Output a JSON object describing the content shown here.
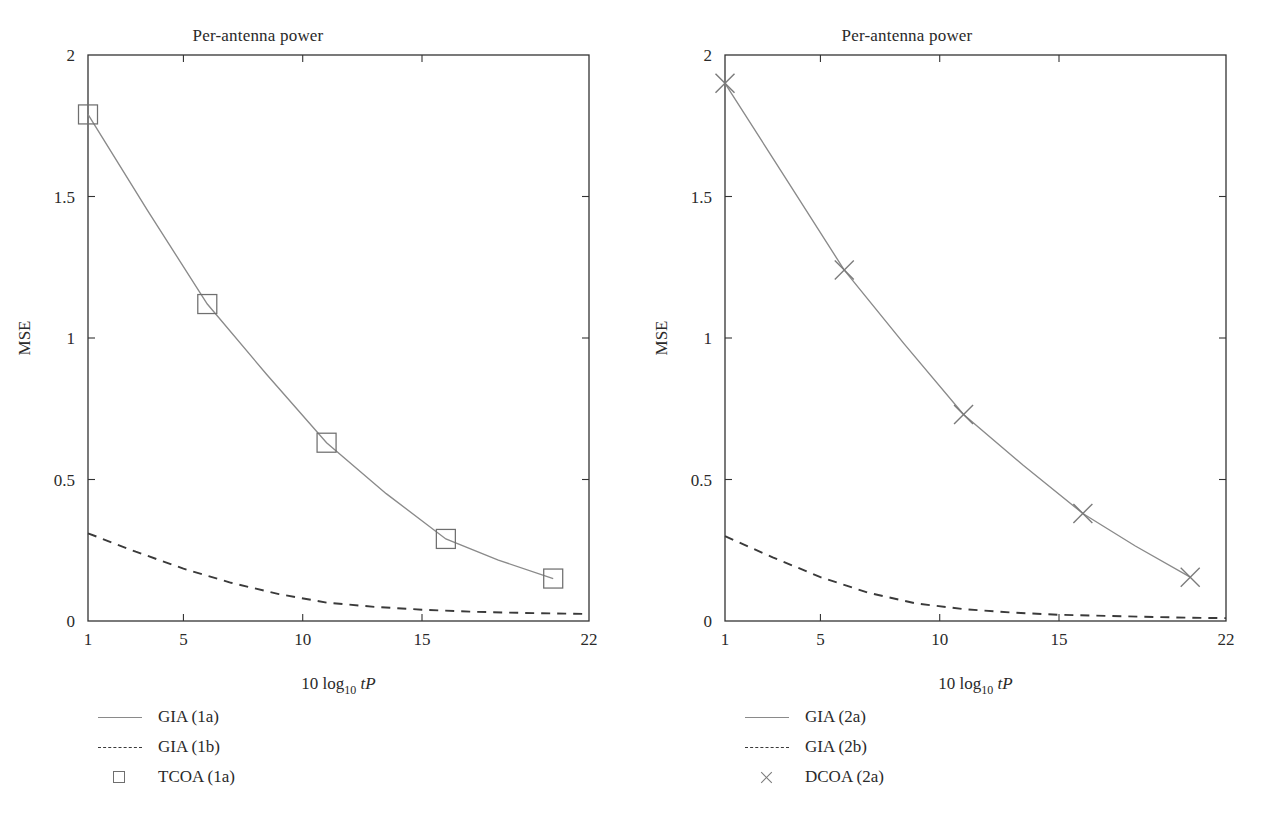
{
  "figure": {
    "background": "#ffffff",
    "panel_count": 2
  },
  "panels": [
    {
      "id": "left",
      "title": "Per-antenna power",
      "ylabel": "MSE",
      "xlabel_parts": {
        "lead": "10 log",
        "sub": "10",
        "var": "tP"
      },
      "legend": [
        {
          "label": "GIA (1a)",
          "key": "solid-line-key"
        },
        {
          "label": "GIA (1b)",
          "key": "dashed-line-key"
        },
        {
          "label": "TCOA (1a)",
          "key": "square-marker-key"
        }
      ]
    },
    {
      "id": "right",
      "title": "Per-antenna power",
      "ylabel": "MSE",
      "xlabel_parts": {
        "lead": "10 log",
        "sub": "10",
        "var": "tP"
      },
      "legend": [
        {
          "label": "GIA (2a)",
          "key": "solid-line-key"
        },
        {
          "label": "GIA (2b)",
          "key": "dashed-line-key"
        },
        {
          "label": "DCOA (2a)",
          "key": "cross-marker-key"
        }
      ]
    }
  ],
  "chart_data": [
    {
      "type": "line",
      "panel": "left",
      "title": "Per-antenna power",
      "xlabel": "10 log10 tP",
      "ylabel": "MSE",
      "xlim": [
        1,
        22
      ],
      "ylim": [
        0,
        2
      ],
      "xticks": [
        1,
        5,
        10,
        15,
        22
      ],
      "xtick_labels": [
        "1",
        "5",
        "10",
        "15",
        "22"
      ],
      "yticks": [
        0,
        0.5,
        1,
        1.5,
        2
      ],
      "ytick_labels": [
        "0",
        "0.5",
        "1",
        "1.5",
        "2"
      ],
      "grid": false,
      "legend_position": "below-left",
      "series": [
        {
          "name": "GIA (1a)",
          "style": "solid",
          "color": "#8a8a8a",
          "marker": "none",
          "x": [
            1,
            3.5,
            6,
            8.5,
            11,
            13.5,
            16,
            18.2,
            20.5
          ],
          "values": [
            1.79,
            1.45,
            1.12,
            0.87,
            0.63,
            0.45,
            0.29,
            0.215,
            0.15
          ]
        },
        {
          "name": "GIA (1b)",
          "style": "dashed",
          "color": "#3a3a3a",
          "marker": "none",
          "x": [
            1,
            3,
            5,
            7,
            9,
            11,
            13,
            15,
            17,
            19,
            21,
            22
          ],
          "values": [
            0.31,
            0.245,
            0.185,
            0.135,
            0.095,
            0.065,
            0.05,
            0.04,
            0.033,
            0.029,
            0.026,
            0.025
          ]
        },
        {
          "name": "TCOA (1a)",
          "style": "markers-only",
          "color": "#6f6f6f",
          "marker": "square",
          "x": [
            1,
            6,
            11,
            16,
            20.5
          ],
          "values": [
            1.79,
            1.12,
            0.63,
            0.29,
            0.15
          ]
        }
      ]
    },
    {
      "type": "line",
      "panel": "right",
      "title": "Per-antenna power",
      "xlabel": "10 log10 tP",
      "ylabel": "MSE",
      "xlim": [
        1,
        22
      ],
      "ylim": [
        0,
        2
      ],
      "xticks": [
        1,
        5,
        10,
        15,
        22
      ],
      "xtick_labels": [
        "1",
        "5",
        "10",
        "15",
        "22"
      ],
      "yticks": [
        0,
        0.5,
        1,
        1.5,
        2
      ],
      "ytick_labels": [
        "0",
        "0.5",
        "1",
        "1.5",
        "2"
      ],
      "grid": false,
      "legend_position": "below-left",
      "series": [
        {
          "name": "GIA (2a)",
          "style": "solid",
          "color": "#8a8a8a",
          "marker": "none",
          "x": [
            1,
            3.5,
            6,
            8.5,
            11,
            13.5,
            16,
            18.2,
            20.5
          ],
          "values": [
            1.9,
            1.57,
            1.24,
            0.98,
            0.73,
            0.55,
            0.38,
            0.265,
            0.155
          ]
        },
        {
          "name": "GIA (2b)",
          "style": "dashed",
          "color": "#3a3a3a",
          "marker": "none",
          "x": [
            1,
            3,
            5,
            7,
            9,
            11,
            13,
            15,
            17,
            19,
            21,
            22
          ],
          "values": [
            0.3,
            0.225,
            0.155,
            0.1,
            0.062,
            0.042,
            0.03,
            0.022,
            0.018,
            0.014,
            0.011,
            0.01
          ]
        },
        {
          "name": "DCOA (2a)",
          "style": "markers-only",
          "color": "#7a7a7a",
          "marker": "cross",
          "x": [
            1,
            6,
            11,
            16,
            20.5
          ],
          "values": [
            1.9,
            1.24,
            0.73,
            0.38,
            0.155
          ]
        }
      ]
    }
  ]
}
